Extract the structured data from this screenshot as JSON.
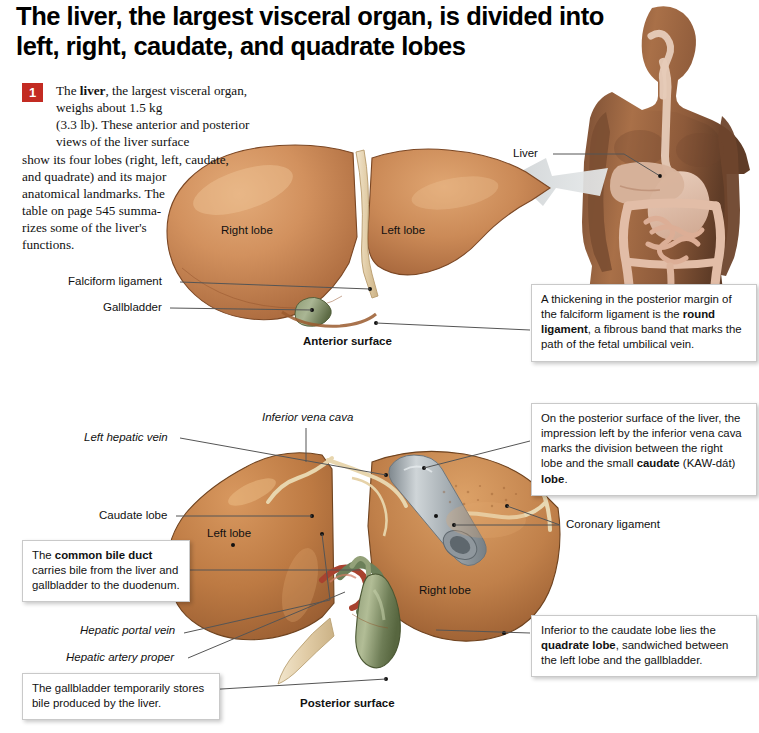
{
  "headline": "The liver, the largest visceral organ, is divided into left, right, caudate, and quadrate lobes",
  "intro": {
    "badge_number": "1",
    "lines": [
      "The <b>liver</b>, the largest visceral organ, weighs about 1.5 kg",
      "(3.3 lb). These anterior and posterior views of the liver surface",
      "show its four lobes (right, left, caudate,",
      "and quadrate) and its major",
      "anatomical landmarks. The",
      "table on page 545 summa-",
      "rizes some of the liver's",
      "functions."
    ]
  },
  "torso": {
    "liver_label": "Liver",
    "caption_alt": "anterior torso with digestive system"
  },
  "anterior": {
    "caption": "Anterior surface",
    "labels": {
      "right_lobe": "Right lobe",
      "left_lobe": "Left lobe",
      "falciform_ligament": "Falciform ligament",
      "gallbladder": "Gallbladder"
    }
  },
  "posterior": {
    "caption": "Posterior surface",
    "labels": {
      "inferior_vena_cava": "Inferior vena cava",
      "left_hepatic_vein": "Left hepatic vein",
      "caudate_lobe": "Caudate lobe",
      "left_lobe": "Left lobe",
      "right_lobe": "Right lobe",
      "coronary_ligament": "Coronary ligament",
      "hepatic_portal_vein": "Hepatic portal vein",
      "hepatic_artery_proper": "Hepatic artery proper"
    }
  },
  "callouts": [
    {
      "id": "round-ligament",
      "html": "A thickening in the posterior margin of the falciform ligament is the <b>round ligament</b>, a fibrous band that marks the path of the fetal umbilical vein."
    },
    {
      "id": "caudate-lobe",
      "html": "On the posterior surface of the liver, the impression left by the inferior vena cava marks the division between the right lobe and the small <b>caudate</b> (KAW-d&aacute;t) <b>lobe</b>."
    },
    {
      "id": "common-bile-duct",
      "html": "The <b>common bile duct</b> carries bile from the liver and gallbladder to the duodenum."
    },
    {
      "id": "gallbladder-function",
      "html": "The gallbladder temporarily stores bile produced by the liver."
    },
    {
      "id": "quadrate-lobe",
      "html": "Inferior to the caudate lobe lies the <b>quadrate lobe</b>, sandwiched between the left lobe and the gallbladder."
    }
  ],
  "colors": {
    "badge_red": "#c32b22",
    "liver_light": "#d89a6a",
    "liver_mid": "#c07f4f",
    "liver_dark": "#a4653c",
    "gallbladder_green": "#7a8a63",
    "vena_cava_gray": "#a9b0b5",
    "ligament_cream": "#ead8b8",
    "leader_gray": "#555555",
    "skin_mid": "#8a5a3c",
    "arrow_gray": "#c8ccce"
  }
}
